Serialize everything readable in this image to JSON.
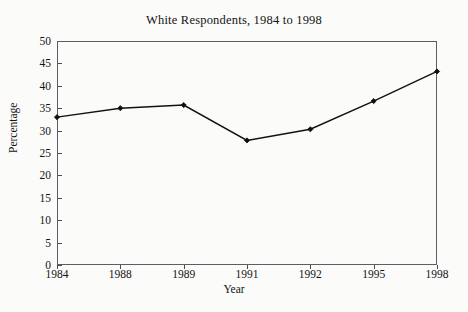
{
  "chart_data": {
    "type": "line",
    "title": "White Respondents, 1984 to 1998",
    "xlabel": "Year",
    "ylabel": "Percentage",
    "categories": [
      "1984",
      "1988",
      "1989",
      "1991",
      "1992",
      "1995",
      "1998"
    ],
    "values": [
      33,
      35,
      35.7,
      27.8,
      30.3,
      36.6,
      43.2
    ],
    "ylim": [
      0,
      50
    ],
    "ytick_values": [
      0,
      5,
      10,
      15,
      20,
      25,
      30,
      35,
      40,
      45,
      50
    ],
    "ytick_labels": [
      "0",
      "5",
      "10",
      "15",
      "20",
      "25",
      "30",
      "35",
      "40",
      "45",
      "50"
    ],
    "grid": false,
    "legend": false,
    "marker": "diamond",
    "line_color": "#111111",
    "marker_color": "#111111",
    "background_color": "#fbfbfa",
    "axis_color": "#5d5d63"
  }
}
